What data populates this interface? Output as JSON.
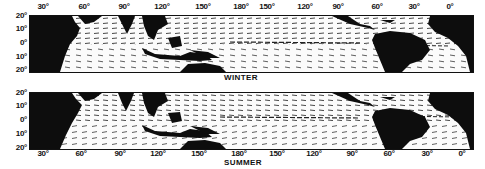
{
  "figure": {
    "panels": [
      {
        "id": "winter",
        "label": "WINTER",
        "lat_labels": [
          "20°",
          "10°",
          "0°",
          "10°",
          "20°"
        ],
        "lon_labels": [
          "30°",
          "60°",
          "90°",
          "120°",
          "150°",
          "180°",
          "150°",
          "120°",
          "90°",
          "60°",
          "30°",
          "0°"
        ],
        "lon_label_position": "top"
      },
      {
        "id": "summer",
        "label": "SUMMER",
        "lat_labels": [
          "20°",
          "10°",
          "0°",
          "10°",
          "20°"
        ],
        "lon_labels": [
          "30°",
          "60°",
          "90°",
          "120°",
          "150°",
          "180°",
          "150°",
          "120°",
          "90°",
          "60°",
          "30°",
          "0°"
        ],
        "lon_label_position": "bottom"
      }
    ],
    "colors": {
      "land": "#0d0d0d",
      "ocean": "#fbfbfb",
      "vectors": "#1a1a1a"
    },
    "content": "Tropical ocean surface vector field (arrows) between 20°N and 20°S, with land masses in black"
  }
}
